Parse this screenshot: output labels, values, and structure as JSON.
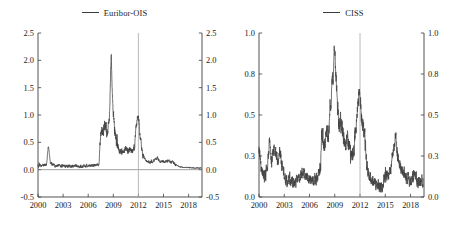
{
  "figure": {
    "width": 458,
    "height": 227,
    "background": "#ffffff",
    "line_color": "#434343",
    "axis_color": "#3f3f3f",
    "vline_color": "#a8a8a8"
  },
  "panels": [
    {
      "id": "euribor-ois",
      "legend_label": "Euribor-OIS",
      "xlabel": "",
      "ylabel": "",
      "xticks": [
        "2000",
        "2003",
        "2006",
        "2009",
        "2012",
        "2015",
        "2018"
      ],
      "xtick_values": [
        2000,
        2003,
        2006,
        2009,
        2012,
        2015,
        2018
      ],
      "xlim": [
        2000,
        2019.6
      ],
      "yticks_left": [
        "2.5",
        "2.0",
        "1.5",
        "1.0",
        "0.5",
        "0.0",
        "-0.5"
      ],
      "yticks_right": [
        "2.5",
        "2.0",
        "1.5",
        "1.0",
        "0.5",
        "0.0",
        "-0.5"
      ],
      "ytick_values": [
        2.5,
        2.0,
        1.5,
        1.0,
        0.5,
        0.0,
        -0.5
      ],
      "ylim": [
        -0.5,
        2.5
      ],
      "zero_line": 0.0,
      "vline_at": 2012,
      "grid": false,
      "legend_position": "top-center"
    },
    {
      "id": "ciss",
      "legend_label": "CISS",
      "xlabel": "",
      "ylabel": "",
      "xticks": [
        "2000",
        "2003",
        "2006",
        "2009",
        "2012",
        "2015",
        "2018"
      ],
      "xtick_values": [
        2000,
        2003,
        2006,
        2009,
        2012,
        2015,
        2018
      ],
      "xlim": [
        2000,
        2019.6
      ],
      "yticks_left": [
        "1.0",
        "0.8",
        "0.5",
        "0.3",
        "0.0"
      ],
      "yticks_right": [
        "1.0",
        "0.8",
        "0.5",
        "0.3",
        "0.0"
      ],
      "ytick_values": [
        1.0,
        0.75,
        0.5,
        0.25,
        0.0
      ],
      "ylim": [
        0.0,
        1.0
      ],
      "zero_line": null,
      "vline_at": 2012,
      "grid": false,
      "legend_position": "top-center"
    }
  ],
  "chart_data": [
    {
      "type": "line",
      "title": "",
      "subtitle": "",
      "xlabel": "",
      "ylabel": "",
      "legend": [
        "Euribor-OIS"
      ],
      "legend_position": "top-center",
      "grid": false,
      "xlim": [
        2000,
        2019.6
      ],
      "ylim": [
        -0.5,
        2.5
      ],
      "xticks": [
        2000,
        2003,
        2006,
        2009,
        2012,
        2015,
        2018
      ],
      "yticks": [
        -0.5,
        0.0,
        0.5,
        1.0,
        1.5,
        2.0,
        2.5
      ],
      "annotations": [
        {
          "type": "vline",
          "x": 2012,
          "color": "#a8a8a8"
        },
        {
          "type": "hline",
          "y": 0.0,
          "color": "#7a7a7a"
        }
      ],
      "series": [
        {
          "name": "Euribor-OIS",
          "color": "#434343",
          "x": [
            2000.0,
            2000.25,
            2000.5,
            2000.75,
            2001.0,
            2001.25,
            2001.5,
            2001.75,
            2002.0,
            2002.25,
            2002.5,
            2002.75,
            2003.0,
            2003.25,
            2003.5,
            2003.75,
            2004.0,
            2004.25,
            2004.5,
            2004.75,
            2005.0,
            2005.25,
            2005.5,
            2005.75,
            2006.0,
            2006.25,
            2006.5,
            2006.75,
            2007.0,
            2007.25,
            2007.5,
            2007.6,
            2007.75,
            2008.0,
            2008.25,
            2008.5,
            2008.75,
            2008.9,
            2009.0,
            2009.25,
            2009.5,
            2009.75,
            2010.0,
            2010.25,
            2010.5,
            2010.75,
            2011.0,
            2011.25,
            2011.5,
            2011.75,
            2011.9,
            2012.0,
            2012.25,
            2012.5,
            2012.75,
            2013.0,
            2013.5,
            2014.0,
            2014.25,
            2014.5,
            2015.0,
            2015.5,
            2016.0,
            2016.5,
            2017.0,
            2017.5,
            2018.0,
            2018.5,
            2019.0,
            2019.5
          ],
          "y": [
            0.07,
            0.08,
            0.07,
            0.09,
            0.1,
            0.42,
            0.12,
            0.09,
            0.08,
            0.07,
            0.08,
            0.06,
            0.07,
            0.06,
            0.07,
            0.07,
            0.06,
            0.06,
            0.07,
            0.06,
            0.06,
            0.06,
            0.07,
            0.07,
            0.08,
            0.07,
            0.08,
            0.08,
            0.09,
            0.08,
            0.62,
            0.72,
            0.68,
            0.82,
            0.7,
            0.9,
            2.05,
            1.35,
            1.02,
            0.62,
            0.42,
            0.34,
            0.3,
            0.36,
            0.38,
            0.33,
            0.36,
            0.32,
            0.4,
            0.8,
            1.0,
            0.95,
            0.55,
            0.3,
            0.2,
            0.15,
            0.13,
            0.18,
            0.22,
            0.16,
            0.15,
            0.16,
            0.14,
            0.09,
            0.05,
            0.04,
            0.04,
            0.03,
            0.03,
            0.03
          ],
          "peak": {
            "x": 2008.9,
            "y": 2.05
          },
          "secondary_peak": {
            "x": 2011.95,
            "y": 1.0
          },
          "pre_crisis_mean": 0.07,
          "post_2017_mean": 0.03
        }
      ]
    },
    {
      "type": "line",
      "title": "",
      "subtitle": "",
      "xlabel": "",
      "ylabel": "",
      "legend": [
        "CISS"
      ],
      "legend_position": "top-center",
      "grid": false,
      "xlim": [
        2000,
        2019.6
      ],
      "ylim": [
        0.0,
        1.0
      ],
      "xticks": [
        2000,
        2003,
        2006,
        2009,
        2012,
        2015,
        2018
      ],
      "yticks": [
        0.0,
        0.25,
        0.5,
        0.75,
        1.0
      ],
      "ytick_labels": [
        "0.0",
        "0.3",
        "0.5",
        "0.8",
        "1.0"
      ],
      "annotations": [
        {
          "type": "vline",
          "x": 2012,
          "color": "#a8a8a8"
        }
      ],
      "series": [
        {
          "name": "CISS",
          "color": "#434343",
          "x": [
            2000.0,
            2000.25,
            2000.5,
            2000.75,
            2001.0,
            2001.25,
            2001.5,
            2001.75,
            2002.0,
            2002.25,
            2002.5,
            2002.75,
            2003.0,
            2003.25,
            2003.5,
            2003.75,
            2004.0,
            2004.25,
            2004.5,
            2004.75,
            2005.0,
            2005.25,
            2005.5,
            2005.75,
            2006.0,
            2006.25,
            2006.5,
            2006.75,
            2007.0,
            2007.25,
            2007.5,
            2007.75,
            2008.0,
            2008.25,
            2008.5,
            2008.75,
            2009.0,
            2009.1,
            2009.25,
            2009.5,
            2009.75,
            2010.0,
            2010.25,
            2010.5,
            2010.75,
            2011.0,
            2011.25,
            2011.5,
            2011.75,
            2011.95,
            2012.0,
            2012.25,
            2012.5,
            2012.75,
            2013.0,
            2013.25,
            2013.5,
            2014.0,
            2014.5,
            2015.0,
            2015.5,
            2016.0,
            2016.25,
            2016.5,
            2017.0,
            2017.5,
            2018.0,
            2018.5,
            2019.0,
            2019.5
          ],
          "y": [
            0.29,
            0.18,
            0.14,
            0.13,
            0.2,
            0.33,
            0.22,
            0.3,
            0.27,
            0.22,
            0.27,
            0.18,
            0.14,
            0.1,
            0.09,
            0.1,
            0.09,
            0.08,
            0.1,
            0.1,
            0.13,
            0.16,
            0.13,
            0.12,
            0.11,
            0.12,
            0.1,
            0.11,
            0.14,
            0.16,
            0.38,
            0.3,
            0.42,
            0.38,
            0.57,
            0.72,
            0.87,
            0.8,
            0.62,
            0.45,
            0.45,
            0.38,
            0.3,
            0.36,
            0.3,
            0.24,
            0.3,
            0.43,
            0.55,
            0.68,
            0.6,
            0.46,
            0.42,
            0.22,
            0.14,
            0.12,
            0.1,
            0.08,
            0.06,
            0.12,
            0.15,
            0.28,
            0.37,
            0.24,
            0.16,
            0.12,
            0.1,
            0.13,
            0.09,
            0.1
          ],
          "peak": {
            "x": 2009.0,
            "y": 0.87
          },
          "secondary_peak": {
            "x": 2011.95,
            "y": 0.68
          },
          "trough": {
            "x": 2014.5,
            "y": 0.06
          }
        }
      ]
    }
  ]
}
